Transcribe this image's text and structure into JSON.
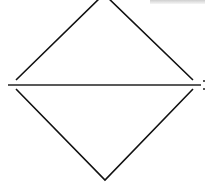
{
  "diagram": {
    "stroke_color": "#111111",
    "background_color": "#ffffff",
    "shapes": {
      "upper_triangle": {
        "left": [
          16,
          80
        ],
        "apex": [
          104,
          -6
        ],
        "right": [
          193,
          80
        ]
      },
      "lower_triangle": {
        "left": [
          16,
          89
        ],
        "apex": [
          105,
          180
        ],
        "right": [
          193,
          89
        ]
      },
      "horizontal_line": {
        "from": [
          8,
          85
        ],
        "to": [
          201,
          85
        ]
      }
    },
    "labels": []
  }
}
